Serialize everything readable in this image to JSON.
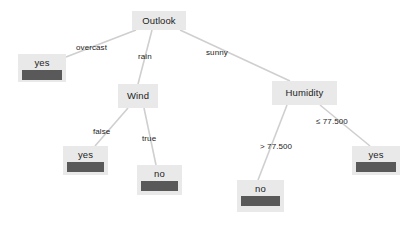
{
  "diagram": {
    "type": "decision-tree",
    "colors": {
      "node_fill": "#e9e9e9",
      "leaf_bar": "#595959",
      "edge_line": "#cfcfcf",
      "text": "#1c1c1c",
      "background": "#ffffff"
    },
    "nodes": [
      {
        "id": "outlook",
        "kind": "internal",
        "label": "Outlook",
        "x": 132,
        "y": 11,
        "w": 54,
        "h": 19
      },
      {
        "id": "leaf_overcast_yes",
        "kind": "leaf",
        "label": "yes",
        "x": 18,
        "y": 54,
        "w": 48,
        "h": 28
      },
      {
        "id": "wind",
        "kind": "internal",
        "label": "Wind",
        "x": 118,
        "y": 84,
        "w": 40,
        "h": 24
      },
      {
        "id": "humidity",
        "kind": "internal",
        "label": "Humidity",
        "x": 272,
        "y": 81,
        "w": 65,
        "h": 24
      },
      {
        "id": "leaf_wind_false_yes",
        "kind": "leaf",
        "label": "yes",
        "x": 63,
        "y": 146,
        "w": 45,
        "h": 29
      },
      {
        "id": "leaf_wind_true_no",
        "kind": "leaf",
        "label": "no",
        "x": 137,
        "y": 165,
        "w": 45,
        "h": 30
      },
      {
        "id": "leaf_humidity_gt_no",
        "kind": "leaf",
        "label": "no",
        "x": 237,
        "y": 180,
        "w": 47,
        "h": 32
      },
      {
        "id": "leaf_humidity_le_yes",
        "kind": "leaf",
        "label": "yes",
        "x": 352,
        "y": 146,
        "w": 48,
        "h": 29
      }
    ],
    "edges": [
      {
        "id": "edge-outlook-overcast",
        "from": "outlook",
        "to": "leaf_overcast_yes",
        "label": "overcast",
        "x1": 136,
        "y1": 30,
        "x2": 66,
        "y2": 57,
        "label_x": 76,
        "label_y": 43
      },
      {
        "id": "edge-outlook-rain",
        "from": "outlook",
        "to": "wind",
        "label": "rain",
        "x1": 152,
        "y1": 30,
        "x2": 138,
        "y2": 84,
        "label_x": 138,
        "label_y": 52
      },
      {
        "id": "edge-outlook-sunny",
        "from": "outlook",
        "to": "humidity",
        "label": "sunny",
        "x1": 180,
        "y1": 30,
        "x2": 290,
        "y2": 81,
        "label_x": 206,
        "label_y": 48
      },
      {
        "id": "edge-wind-false",
        "from": "wind",
        "to": "leaf_wind_false_yes",
        "label": "false",
        "x1": 128,
        "y1": 108,
        "x2": 95,
        "y2": 146,
        "label_x": 93,
        "label_y": 127
      },
      {
        "id": "edge-wind-true",
        "from": "wind",
        "to": "leaf_wind_true_no",
        "label": "true",
        "x1": 144,
        "y1": 108,
        "x2": 156,
        "y2": 165,
        "label_x": 142,
        "label_y": 134
      },
      {
        "id": "edge-humidity-gt",
        "from": "humidity",
        "to": "leaf_humidity_gt_no",
        "label": "> 77.500",
        "x1": 287,
        "y1": 105,
        "x2": 258,
        "y2": 180,
        "label_x": 260,
        "label_y": 142
      },
      {
        "id": "edge-humidity-le",
        "from": "humidity",
        "to": "leaf_humidity_le_yes",
        "label": "≤ 77.500",
        "x1": 320,
        "y1": 105,
        "x2": 370,
        "y2": 146,
        "label_x": 316,
        "label_y": 117
      }
    ]
  }
}
